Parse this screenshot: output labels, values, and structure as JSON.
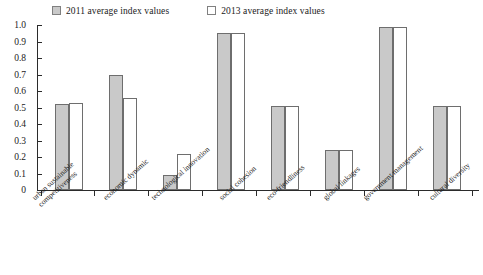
{
  "legend": {
    "entries": [
      {
        "label": "2011 average index values",
        "swatch": "gray-filled",
        "color": "#c9c9c9"
      },
      {
        "label": "2013 average index values",
        "swatch": "white-outlined",
        "color": "#ffffff"
      }
    ]
  },
  "axes": {
    "y_ticks": [
      "1.0",
      "0.9",
      "0.8",
      "0.7",
      "0.6",
      "0.5",
      "0.4",
      "0.3",
      "0.2",
      "0.1",
      "0"
    ]
  },
  "chart_data": {
    "type": "bar",
    "title": "",
    "subtitle": "",
    "xlabel": "",
    "ylabel": "",
    "ylim": [
      0,
      1.0
    ],
    "ytick_values": [
      0,
      0.1,
      0.2,
      0.3,
      0.4,
      0.5,
      0.6,
      0.7,
      0.8,
      0.9,
      1.0
    ],
    "grid": false,
    "legend_position": "top",
    "categories": [
      "urban sustainable competitiveness",
      "economic dynamic",
      "technological innovation",
      "social cohesion",
      "eco-friendliness",
      "global linkages",
      "government management",
      "cultural diversity"
    ],
    "category_lines": [
      [
        "urban sustainable",
        "competitiveness"
      ],
      [
        "economic dynamic"
      ],
      [
        "technological innovation"
      ],
      [
        "social cohesion"
      ],
      [
        "eco-friendliness"
      ],
      [
        "global linkages"
      ],
      [
        "government management"
      ],
      [
        "cultural diversity"
      ]
    ],
    "series": [
      {
        "name": "2011 average index values",
        "color": "#c9c9c9",
        "values": [
          0.52,
          0.7,
          0.09,
          0.95,
          0.51,
          0.24,
          0.99,
          0.51
        ]
      },
      {
        "name": "2013 average index values",
        "color": "#ffffff",
        "values": [
          0.53,
          0.56,
          0.22,
          0.95,
          0.51,
          0.24,
          0.99,
          0.51
        ]
      }
    ]
  }
}
